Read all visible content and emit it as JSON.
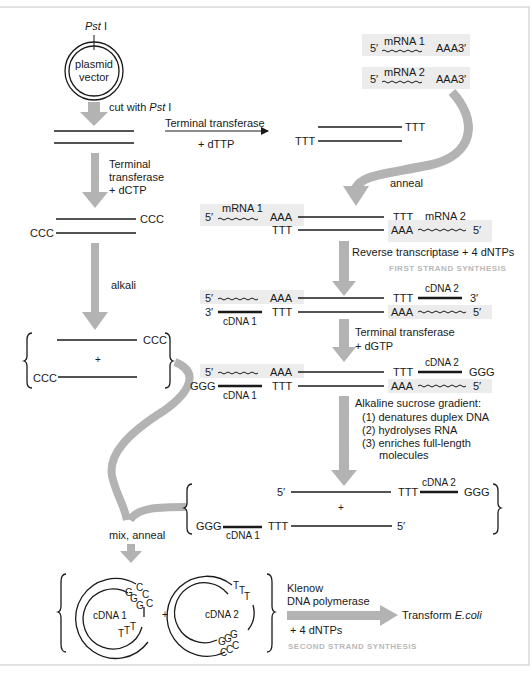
{
  "diagram": {
    "colors": {
      "arrow": "#b3b3b3",
      "mrna_box": "#ececec",
      "line": "#1a1a1a",
      "caption": "#b8b8b8",
      "frame": "#d8d8d8"
    },
    "plasmid": {
      "site": "Pst I",
      "site_name": "Pst",
      "site_numeral": "I",
      "label_line1": "plasmid",
      "label_line2": "vector"
    },
    "steps": {
      "cut": {
        "prefix": "cut with ",
        "enzyme": "Pst",
        "numeral": " I"
      },
      "tt_dttp": {
        "line1": "Terminal transferase",
        "line2": "+ dTTP"
      },
      "tt_dctp": {
        "line1": "Terminal",
        "line2": "transferase",
        "line3": "+ dCTP"
      },
      "alkali": "alkali",
      "anneal": "anneal",
      "rt": {
        "label": "Reverse transcriptase + 4 dNTPs",
        "caption": "FIRST STRAND SYNTHESIS"
      },
      "tt_dgtp": {
        "line1": "Terminal transferase",
        "line2": "+ dGTP"
      },
      "sucrose": {
        "title": "Alkaline sucrose gradient:",
        "items": [
          "(1) denatures duplex DNA",
          "(2) hydrolyses RNA",
          "(3) enriches full-length",
          "molecules"
        ]
      },
      "mix": "mix, anneal",
      "klenow": {
        "line1": "Klenow",
        "line2": "DNA polymerase",
        "line3": "+ 4 dNTPs",
        "caption": "SECOND STRAND SYNTHESIS"
      },
      "transform": {
        "prefix": "Transform ",
        "organism": "E.coli"
      }
    },
    "labels": {
      "ccc": "CCC",
      "ttt": "TTT",
      "aaa": "AAA",
      "ggg": "GGG",
      "five": "5′",
      "three": "3′",
      "plus": "+",
      "mrna1": "mRNA 1",
      "mrna2": "mRNA 2",
      "cdna1": "cDNA 1",
      "cdna2": "cDNA 2",
      "g": "G",
      "c": "C",
      "t": "T"
    }
  }
}
